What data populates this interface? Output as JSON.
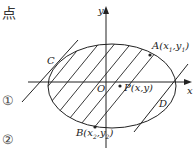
{
  "header": {
    "text_fragment": "点"
  },
  "markers": {
    "line1": "①",
    "line2": "②"
  },
  "labels": {
    "y_axis": "y",
    "x_axis": "x",
    "origin": "O",
    "point_a": "A",
    "point_a_coords": "(x",
    "point_a_sub": "1",
    "point_a_mid": ",y",
    "point_a_sub2": "1",
    "point_a_close": ")",
    "point_b": "B",
    "point_b_coords": "(x",
    "point_b_sub": "2",
    "point_b_mid": ",y",
    "point_b_sub2": "2",
    "point_b_close": ")",
    "point_c": "C",
    "point_d": "D",
    "point_p": "P(x,y)"
  },
  "colors": {
    "stroke": "#222222",
    "background": "#ffffff"
  }
}
